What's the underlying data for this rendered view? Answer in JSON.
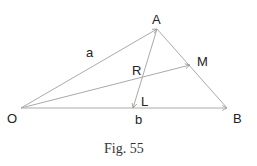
{
  "figure": {
    "caption": "Fig. 55",
    "points": {
      "O": {
        "label": "O",
        "x": 21,
        "y": 108
      },
      "A": {
        "label": "A",
        "x": 157,
        "y": 29
      },
      "B": {
        "label": "B",
        "x": 227,
        "y": 108
      },
      "M": {
        "label": "M",
        "x": 190,
        "y": 65
      },
      "L": {
        "label": "L",
        "x": 133,
        "y": 108
      },
      "R": {
        "label": "R",
        "x": 143,
        "y": 77
      }
    },
    "vector_labels": {
      "a": "a",
      "b": "b"
    },
    "segments": [
      {
        "from": "O",
        "to": "A",
        "arrow": true
      },
      {
        "from": "O",
        "to": "B",
        "arrow": true
      },
      {
        "from": "A",
        "to": "B",
        "arrow": false
      },
      {
        "from": "O",
        "to": "M",
        "arrow": true
      },
      {
        "from": "A",
        "to": "L",
        "arrow": true
      }
    ],
    "line_color": "#aaaaaa",
    "text_color": "#222222"
  }
}
